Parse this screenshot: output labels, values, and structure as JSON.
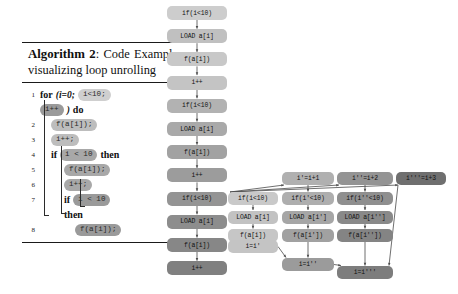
{
  "algorithm": {
    "caption_number": "Algorithm 2",
    "caption_sep": ": ",
    "caption_text": "Code Example visualizing loop unrolling",
    "lines": [
      {
        "number": "1",
        "indent": 0,
        "tokens": [
          {
            "type": "kw",
            "text": "for"
          },
          {
            "type": "plain",
            "text": "(i=0;"
          },
          {
            "type": "pill",
            "text": "i<10;",
            "shade": "lvl1"
          }
        ]
      },
      {
        "number": "",
        "indent": 0,
        "tokens": [
          {
            "type": "pill",
            "text": "i++",
            "shade": "lvl4"
          },
          {
            "type": "plain",
            "text": ")"
          },
          {
            "type": "kw",
            "text": "do"
          }
        ]
      },
      {
        "number": "2",
        "indent": 1,
        "tokens": [
          {
            "type": "pill",
            "text": "f(a[i]);",
            "shade": "lvl2"
          }
        ]
      },
      {
        "number": "3",
        "indent": 1,
        "tokens": [
          {
            "type": "pill",
            "text": "i++;",
            "shade": "lvl2"
          }
        ]
      },
      {
        "number": "4",
        "indent": 1,
        "tokens": [
          {
            "type": "kw",
            "text": "if"
          },
          {
            "type": "pill",
            "text": "i < 10",
            "shade": "lvl3"
          },
          {
            "type": "kw",
            "text": "then"
          }
        ]
      },
      {
        "number": "5",
        "indent": 2,
        "tokens": [
          {
            "type": "pill",
            "text": "f(a[i]);",
            "shade": "lvl3"
          }
        ]
      },
      {
        "number": "6",
        "indent": 2,
        "tokens": [
          {
            "type": "pill",
            "text": "i++;",
            "shade": "lvl3"
          }
        ]
      },
      {
        "number": "7",
        "indent": 2,
        "tokens": [
          {
            "type": "kw",
            "text": "if"
          },
          {
            "type": "pill",
            "text": "i < 10",
            "shade": "lvl4"
          }
        ]
      },
      {
        "number": "",
        "indent": 2,
        "tokens": [
          {
            "type": "kw",
            "text": "then"
          }
        ]
      },
      {
        "number": "8",
        "indent": 3,
        "tokens": [
          {
            "type": "pill",
            "text": "f(a[i]);",
            "shade": "lvl4"
          }
        ]
      }
    ]
  },
  "middle_column": {
    "title": "sequential-unrolled-trace",
    "nodes": [
      {
        "label": "if(i<10)",
        "color": "#cdcdcd"
      },
      {
        "label": "LOAD a[i]",
        "color": "#c0c0c0"
      },
      {
        "label": "f(a[i])",
        "color": "#c8c8c8"
      },
      {
        "label": "i++",
        "color": "#c4c4c4"
      },
      {
        "label": "if(i<10)",
        "color": "#b2b2b2"
      },
      {
        "label": "LOAD a[i]",
        "color": "#a9a9a9"
      },
      {
        "label": "f(a[i])",
        "color": "#a2a2a2"
      },
      {
        "label": "i++",
        "color": "#9c9c9c"
      },
      {
        "label": "if(i<10)",
        "color": "#949494"
      },
      {
        "label": "LOAD a[i]",
        "color": "#8d8d8d"
      },
      {
        "label": "f(a[i])",
        "color": "#878787"
      },
      {
        "label": "i++",
        "color": "#808080"
      }
    ]
  },
  "dag": {
    "title": "parallel-unrolled-dag",
    "columns": [
      {
        "header": null,
        "nodes": [
          {
            "label": "if(i<10)",
            "color": "#c9c9c9"
          },
          {
            "label": "LOAD a[i]",
            "color": "#c2c2c2"
          },
          {
            "label": "f(a[i])",
            "color": "#c6c6c6"
          }
        ],
        "merge": {
          "label": "i=i'",
          "color": "#c4c4c4"
        }
      },
      {
        "header": {
          "label": "i'=i+1",
          "color": "#b0b0b0"
        },
        "nodes": [
          {
            "label": "if(i'<10)",
            "color": "#aeaeae"
          },
          {
            "label": "LOAD a[i']",
            "color": "#a6a6a6"
          },
          {
            "label": "f(a[i'])",
            "color": "#a1a1a1"
          }
        ],
        "merge": {
          "label": "i=i''",
          "color": "#9b9b9b"
        }
      },
      {
        "header": {
          "label": "i''=i+2",
          "color": "#949494"
        },
        "nodes": [
          {
            "label": "if(i''<10)",
            "color": "#8f8f8f"
          },
          {
            "label": "LOAD a[i'']",
            "color": "#898989"
          },
          {
            "label": "f(a[i''])",
            "color": "#848484"
          }
        ],
        "merge": {
          "label": "i=i'''",
          "color": "#7d7d7d"
        }
      },
      {
        "header": {
          "label": "i'''=i+3",
          "color": "#6f6f6f"
        },
        "nodes": [],
        "merge": null
      }
    ]
  },
  "colors": {
    "page_background": "#ffffff",
    "text": "#101010",
    "edge": "#4a4a4a",
    "rule": "#1a1a1a"
  }
}
